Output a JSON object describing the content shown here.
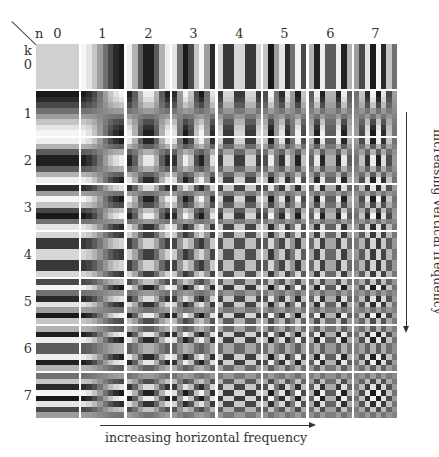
{
  "header": {
    "corner_n_label": "n",
    "corner_k_label": "k"
  },
  "axes": {
    "horizontal_label": "increasing horizontal frequency",
    "vertical_label": "increasing vertical frequency"
  },
  "column_labels": [
    "0",
    "1",
    "2",
    "3",
    "4",
    "5",
    "6",
    "7"
  ],
  "row_labels": [
    "0",
    "1",
    "2",
    "3",
    "4",
    "5",
    "6",
    "7"
  ],
  "layout": {
    "tile_x": [
      36,
      81,
      127,
      172,
      218,
      263,
      309,
      354
    ],
    "tile_y": [
      44,
      91,
      138,
      185,
      232,
      279,
      326,
      373
    ],
    "gray_mid": 135,
    "gray_amp": 112,
    "dc_gray": 208
  },
  "chart_data": {
    "type": "heatmap",
    "xlabel": "n (increasing horizontal frequency)",
    "ylabel": "k (increasing vertical frequency)",
    "n_values": [
      0,
      1,
      2,
      3,
      4,
      5,
      6,
      7
    ],
    "k_values": [
      0,
      1,
      2,
      3,
      4,
      5,
      6,
      7
    ],
    "cos_table": [
      [
        1.0,
        1.0,
        1.0,
        1.0,
        1.0,
        1.0,
        1.0,
        1.0
      ],
      [
        0.981,
        0.831,
        0.556,
        0.195,
        -0.195,
        -0.556,
        -0.831,
        -0.981
      ],
      [
        0.924,
        0.383,
        -0.383,
        -0.924,
        -0.924,
        -0.383,
        0.383,
        0.924
      ],
      [
        0.831,
        -0.195,
        -0.981,
        -0.556,
        0.556,
        0.981,
        0.195,
        -0.831
      ],
      [
        0.707,
        -0.707,
        -0.707,
        0.707,
        0.707,
        -0.707,
        -0.707,
        0.707
      ],
      [
        0.556,
        -0.981,
        0.195,
        0.831,
        -0.831,
        -0.195,
        0.981,
        -0.556
      ],
      [
        0.383,
        -0.924,
        0.924,
        -0.383,
        -0.383,
        0.924,
        -0.924,
        0.383
      ],
      [
        0.195,
        -0.556,
        0.831,
        -0.981,
        0.981,
        -0.831,
        0.556,
        -0.195
      ]
    ]
  }
}
